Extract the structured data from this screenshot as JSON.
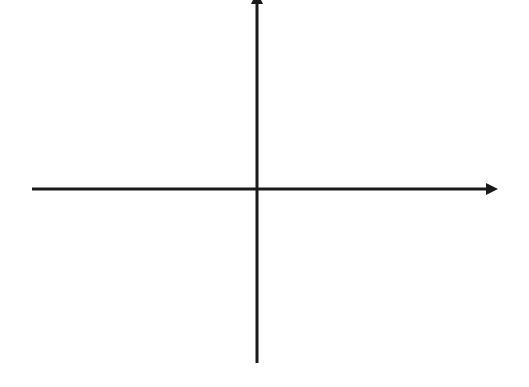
{
  "diagram": {
    "type": "coordinate-axes",
    "background": "#ffffff",
    "line_color": "#1a1a1a",
    "line_width": 3,
    "x_axis": {
      "x_start": 32,
      "x_end": 498,
      "y": 189,
      "arrow_at_end": true,
      "arrowhead": {
        "length": 12,
        "half_width": 6
      }
    },
    "y_axis": {
      "x": 257,
      "y_start": 363,
      "y_end": 0,
      "arrow_at_end": true,
      "arrowhead": {
        "length": 12,
        "half_width": 6,
        "clipped_by_edge": true
      }
    },
    "labels": []
  }
}
